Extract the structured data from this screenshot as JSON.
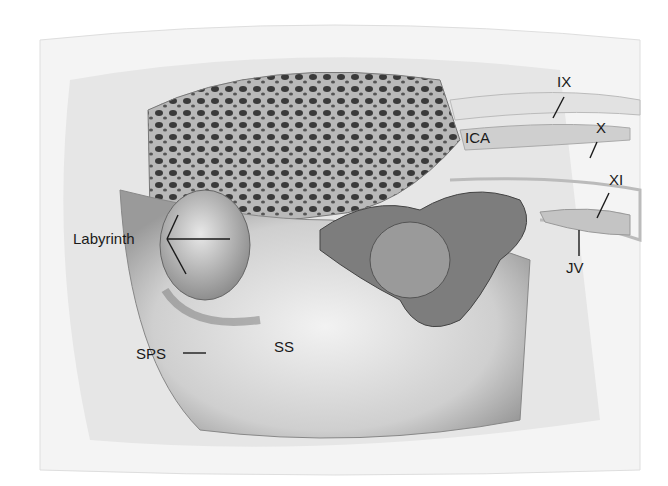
{
  "figure": {
    "type": "anatomical illustration",
    "labels": {
      "ix": "IX",
      "x": "X",
      "xi": "XI",
      "ica": "ICA",
      "jv": "JV",
      "labyrinth": "Labyrinth",
      "sps": "SPS",
      "ss": "SS"
    },
    "colors": {
      "background": "#ffffff",
      "bone_light": "#ececec",
      "bone_mid": "#c8c8c8",
      "shadow": "#6a6a6a",
      "label": "#1a1a1a"
    }
  }
}
